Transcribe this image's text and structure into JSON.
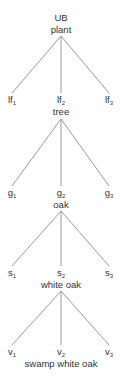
{
  "diagram": {
    "type": "taxonomy-tree",
    "edge_color": "#9a9a9a",
    "text_color": "#333333",
    "root": {
      "line1": "UB",
      "line2": "plant"
    },
    "levels": [
      {
        "prefix": "lf",
        "children": [
          {
            "base": "lf",
            "sub": "1"
          },
          {
            "base": "lf",
            "sub": "2"
          },
          {
            "base": "lf",
            "sub": "3"
          }
        ],
        "label": "tree"
      },
      {
        "prefix": "g",
        "children": [
          {
            "base": "g",
            "sub": "1"
          },
          {
            "base": "g",
            "sub": "2"
          },
          {
            "base": "g",
            "sub": "3"
          }
        ],
        "label": "oak"
      },
      {
        "prefix": "s",
        "children": [
          {
            "base": "s",
            "sub": "1"
          },
          {
            "base": "s",
            "sub": "2"
          },
          {
            "base": "s",
            "sub": "3"
          }
        ],
        "label": "white oak"
      },
      {
        "prefix": "v",
        "children": [
          {
            "base": "v",
            "sub": "1"
          },
          {
            "base": "v",
            "sub": "2"
          },
          {
            "base": "v",
            "sub": "3"
          }
        ],
        "label": "swamp white oak"
      }
    ]
  }
}
